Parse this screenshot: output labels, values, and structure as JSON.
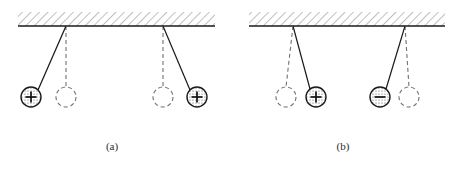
{
  "figure": {
    "title": "",
    "width": 463,
    "height": 169,
    "background": "#ffffff",
    "ink_color": "#1a1a1a",
    "hatch_color": "#8a8a8a",
    "sphere_fill": "#d9d9d9",
    "dashed_color": "#707070"
  },
  "panels": [
    {
      "id": "a",
      "caption": "(a)",
      "caption_x": 112,
      "caption_y": 150,
      "interaction": "repulsion",
      "ceiling": {
        "x": 18,
        "y": 12,
        "width": 197,
        "height": 14,
        "baseline_y": 26
      },
      "pendulums": [
        {
          "name": "left",
          "pivot_x": 66,
          "pivot_y": 26,
          "bob_x": 31,
          "bob_y": 97,
          "rest_x": 66,
          "rest_y": 97,
          "radius": 10,
          "charge": "+",
          "charge_label": "plus",
          "swing": "left"
        },
        {
          "name": "right",
          "pivot_x": 163,
          "pivot_y": 26,
          "bob_x": 197,
          "bob_y": 97,
          "rest_x": 163,
          "rest_y": 97,
          "radius": 10,
          "charge": "+",
          "charge_label": "plus",
          "swing": "right"
        }
      ]
    },
    {
      "id": "b",
      "caption": "(b)",
      "caption_x": 343,
      "caption_y": 150,
      "interaction": "attraction",
      "ceiling": {
        "x": 249,
        "y": 12,
        "width": 196,
        "height": 14,
        "baseline_y": 26
      },
      "pendulums": [
        {
          "name": "left",
          "pivot_x": 293,
          "pivot_y": 26,
          "bob_x": 316,
          "bob_y": 97,
          "rest_x": 286,
          "rest_y": 97,
          "radius": 10,
          "charge": "+",
          "charge_label": "plus",
          "swing": "right"
        },
        {
          "name": "right",
          "pivot_x": 405,
          "pivot_y": 26,
          "bob_x": 380,
          "bob_y": 97,
          "rest_x": 409,
          "rest_y": 97,
          "radius": 10,
          "charge": "-",
          "charge_label": "minus",
          "swing": "left"
        }
      ]
    }
  ]
}
